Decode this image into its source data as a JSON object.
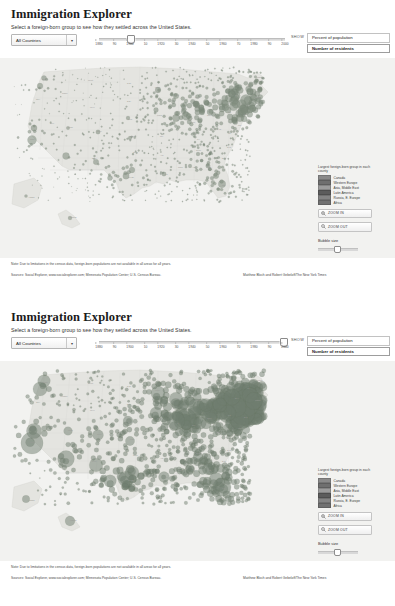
{
  "app": {
    "title": "Immigration Explorer",
    "subtitle": "Select a foreign-born group to see how they settled across the United States."
  },
  "controls": {
    "country_select": {
      "value": "All Countries",
      "caret_icon": "chevron-down-icon"
    },
    "timeline": {
      "ticks": [
        "1880",
        "90",
        "1900",
        "10",
        "1920",
        "30",
        "1940",
        "50",
        "1960",
        "70",
        "1980",
        "90",
        "2000"
      ],
      "min_year": 1880,
      "max_year": 2000
    },
    "show": {
      "label": "SHOW",
      "options": [
        "Percent of population",
        "Number of residents"
      ],
      "selected": "Number of residents"
    }
  },
  "legend": {
    "title": "Largest foreign-born group in each county",
    "items": [
      {
        "label": "Canada",
        "color": "#8a8a8a"
      },
      {
        "label": "Western Europe",
        "color": "#6f6f6f"
      },
      {
        "label": "Asia, Middle East",
        "color": "#9c9c9c"
      },
      {
        "label": "Latin America",
        "color": "#5c5c5c"
      },
      {
        "label": "Russia, E. Europe",
        "color": "#848484"
      },
      {
        "label": "Africa",
        "color": "#717171"
      }
    ]
  },
  "map_tools": {
    "zoom_in": {
      "label": "ZOOM IN",
      "icon": "magnifier-plus-icon"
    },
    "zoom_out": {
      "label": "ZOOM OUT",
      "icon": "magnifier-minus-icon"
    },
    "bubble_size": {
      "label": "Bubble size",
      "value": 40
    }
  },
  "state_labels": [
    {
      "t": "Wash.",
      "x": 42,
      "y": 22
    },
    {
      "t": "Ore.",
      "x": 36,
      "y": 42
    },
    {
      "t": "Calif.",
      "x": 30,
      "y": 82
    },
    {
      "t": "Nev.",
      "x": 50,
      "y": 66
    },
    {
      "t": "Idaho",
      "x": 62,
      "y": 36
    },
    {
      "t": "Mont.",
      "x": 88,
      "y": 23
    },
    {
      "t": "Wyo.",
      "x": 90,
      "y": 50
    },
    {
      "t": "Utah",
      "x": 68,
      "y": 70
    },
    {
      "t": "Ariz.",
      "x": 66,
      "y": 100
    },
    {
      "t": "Colo.",
      "x": 97,
      "y": 74
    },
    {
      "t": "N.M.",
      "x": 92,
      "y": 101
    },
    {
      "t": "N.D.",
      "x": 127,
      "y": 26
    },
    {
      "t": "S.D.",
      "x": 127,
      "y": 44
    },
    {
      "t": "Neb.",
      "x": 128,
      "y": 62
    },
    {
      "t": "Kan.",
      "x": 130,
      "y": 79
    },
    {
      "t": "Okla.",
      "x": 133,
      "y": 95
    },
    {
      "t": "Texas",
      "x": 128,
      "y": 120
    },
    {
      "t": "Minn.",
      "x": 155,
      "y": 30
    },
    {
      "t": "Iowa",
      "x": 157,
      "y": 58
    },
    {
      "t": "Mo.",
      "x": 160,
      "y": 79
    },
    {
      "t": "Ark.",
      "x": 160,
      "y": 98
    },
    {
      "t": "La.",
      "x": 165,
      "y": 117
    },
    {
      "t": "Wis.",
      "x": 175,
      "y": 38
    },
    {
      "t": "Ill.",
      "x": 177,
      "y": 63
    },
    {
      "t": "Miss.",
      "x": 178,
      "y": 110
    },
    {
      "t": "Mich.",
      "x": 195,
      "y": 40
    },
    {
      "t": "Ind.",
      "x": 192,
      "y": 65
    },
    {
      "t": "Ky.",
      "x": 197,
      "y": 82
    },
    {
      "t": "Tenn.",
      "x": 196,
      "y": 93
    },
    {
      "t": "Ala.",
      "x": 192,
      "y": 110
    },
    {
      "t": "Ohio",
      "x": 207,
      "y": 58
    },
    {
      "t": "Ga.",
      "x": 208,
      "y": 110
    },
    {
      "t": "Fla.",
      "x": 222,
      "y": 128
    },
    {
      "t": "W.Va.",
      "x": 216,
      "y": 72
    },
    {
      "t": "Va.",
      "x": 228,
      "y": 76
    },
    {
      "t": "N.C.",
      "x": 227,
      "y": 90
    },
    {
      "t": "S.C.",
      "x": 222,
      "y": 101
    },
    {
      "t": "Pa.",
      "x": 228,
      "y": 55
    },
    {
      "t": "N.Y.",
      "x": 235,
      "y": 38
    },
    {
      "t": "Maine",
      "x": 257,
      "y": 20
    },
    {
      "t": "Vt.",
      "x": 247,
      "y": 28
    },
    {
      "t": "Mass.",
      "x": 255,
      "y": 40
    },
    {
      "t": "Md.",
      "x": 238,
      "y": 68
    },
    {
      "t": "N.J.",
      "x": 244,
      "y": 57
    },
    {
      "t": "Alaska",
      "x": 28,
      "y": 140
    },
    {
      "t": "Hawaii",
      "x": 70,
      "y": 160
    }
  ],
  "footer": {
    "note": "Note: Due to limitations in the census data, foreign-born populations are not available in all areas for all years.",
    "sources": "Sources: Social Explorer, www.socialexplorer.com; Minnesota Population Center; U.S. Census Bureau.",
    "credit": "Matthew Bloch and Robert Gebeloff/The New York Times"
  },
  "panels": [
    {
      "id": "panel-top",
      "slider_year": "1900",
      "slider_pct": 16.5,
      "bubble_scale": 1.0
    },
    {
      "id": "panel-bottom",
      "slider_year": "2000",
      "slider_pct": 99.0,
      "bubble_scale": 2.45
    }
  ]
}
